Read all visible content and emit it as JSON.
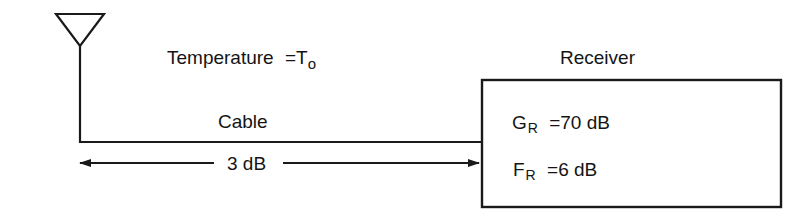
{
  "diagram": {
    "type": "receiver-noise-block-diagram",
    "antenna": {
      "icon": "antenna-icon"
    },
    "temperature": {
      "label": "Temperature",
      "equals": "=",
      "symbol": "T",
      "subscript": "o"
    },
    "cable": {
      "label": "Cable",
      "loss": "3 dB"
    },
    "receiver": {
      "title": "Receiver",
      "gain": {
        "symbol": "G",
        "subscript": "R",
        "equals": "=",
        "value": "70 dB"
      },
      "noise_figure": {
        "symbol": "F",
        "subscript": "R",
        "equals": "=",
        "value": "6 dB"
      }
    },
    "colors": {
      "stroke": "#1a1a1a",
      "background": "#ffffff"
    }
  }
}
